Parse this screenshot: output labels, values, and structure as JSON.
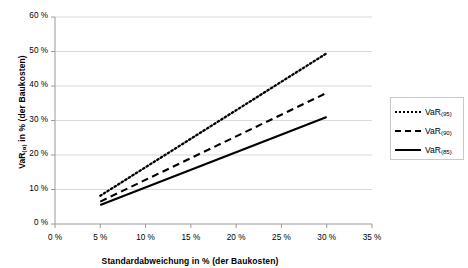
{
  "chart_data": {
    "type": "line",
    "title": "",
    "subtitle": "",
    "xlabel": "Standardabweichung in % (der Baukosten)",
    "ylabel_parts": {
      "base": "VaR",
      "sub": "(α)",
      "rest": " in % (der Baukosten)"
    },
    "ylabel": "VaR(α) in % (der Baukosten)",
    "xlim": [
      0,
      35
    ],
    "ylim": [
      0,
      60
    ],
    "xticks": [
      0,
      5,
      10,
      15,
      20,
      25,
      30,
      35
    ],
    "yticks": [
      0,
      10,
      20,
      30,
      40,
      50,
      60
    ],
    "xticklabels": [
      "0 %",
      "5 %",
      "10 %",
      "15 %",
      "20 %",
      "25 %",
      "30 %",
      "35 %"
    ],
    "yticklabels": [
      "0 %",
      "10 %",
      "20 %",
      "30 %",
      "40 %",
      "50 %",
      "60 %"
    ],
    "grid": "horizontal",
    "grid_color": "#d9d9d9",
    "legend_position": "right",
    "x": [
      5,
      30
    ],
    "series": [
      {
        "name": "VaR(95)",
        "label_base": "VaR",
        "label_sub": "(95)",
        "style": "dotted",
        "color": "#000000",
        "values": [
          8.2,
          49.5
        ]
      },
      {
        "name": "VaR(90)",
        "label_base": "VaR",
        "label_sub": "(90)",
        "style": "dashed",
        "color": "#000000",
        "values": [
          6.5,
          38.0
        ]
      },
      {
        "name": "VaR(85)",
        "label_base": "VaR",
        "label_sub": "(85)",
        "style": "solid",
        "color": "#000000",
        "values": [
          5.5,
          31.0
        ]
      }
    ]
  }
}
